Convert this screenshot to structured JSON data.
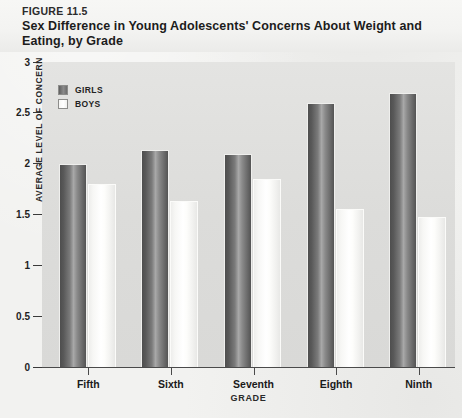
{
  "header": {
    "figure_number": "FIGURE 11.5",
    "title": "Sex Difference in Young Adolescents' Concerns About Weight and Eating, by Grade"
  },
  "legend": {
    "position": "top-left-inside-plot",
    "entries": [
      {
        "label": "GIRLS",
        "swatch": "dark-gray-gradient",
        "color": "#6d6d6d"
      },
      {
        "label": "BOYS",
        "swatch": "white-gradient",
        "color": "#ffffff"
      }
    ]
  },
  "axes": {
    "y_title": "AVERAGE LEVEL OF CONCERN",
    "x_title": "GRADE",
    "y_ticks": [
      "0",
      "0.5",
      "1",
      "1.5",
      "2",
      "2.5",
      "3"
    ],
    "x_ticks": [
      "Fifth",
      "Sixth",
      "Seventh",
      "Eighth",
      "Ninth"
    ]
  },
  "chart_data": {
    "type": "bar",
    "title": "Sex Difference in Young Adolescents' Concerns About Weight and Eating, by Grade",
    "xlabel": "GRADE",
    "ylabel": "AVERAGE LEVEL OF CONCERN",
    "categories": [
      "Fifth",
      "Sixth",
      "Seventh",
      "Eighth",
      "Ninth"
    ],
    "series": [
      {
        "name": "GIRLS",
        "color": "#6d6d6d",
        "values": [
          2.0,
          2.13,
          2.1,
          2.6,
          2.7
        ]
      },
      {
        "name": "BOYS",
        "color": "#ffffff",
        "values": [
          1.8,
          1.63,
          1.85,
          1.55,
          1.48
        ]
      }
    ],
    "ylim": [
      0,
      3
    ],
    "ytick_step": 0.5,
    "grid": false,
    "legend_position": "upper left"
  }
}
